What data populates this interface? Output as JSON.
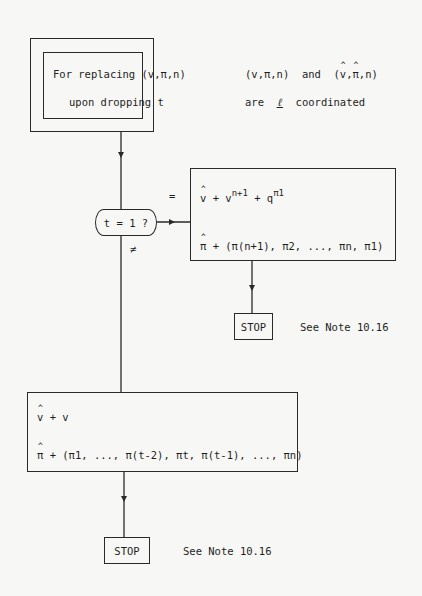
{
  "header_box": {
    "line1": "For replacing  (v,π,n)",
    "line2": "upon dropping t"
  },
  "side_note": {
    "line1_a": "(v,π,n)",
    "line1_and": "and",
    "line1_b": "(v,π,n)",
    "line2_are": "are",
    "line2_l": "ℓ",
    "line2_coord": "coordinated"
  },
  "decision": {
    "label": "t = 1 ?",
    "eq_label": "=",
    "neq_label": "≠"
  },
  "true_branch": {
    "v_lhs": "v",
    "v_rhs_base": "+ v",
    "v_rhs_sup": "n+1",
    "v_rhs_q": "+ q",
    "v_rhs_qsup": "π1",
    "pi_lhs": "π",
    "pi_rhs": "+ (π(n+1), π2, ..., πn, π1)"
  },
  "stop1": {
    "label": "STOP",
    "note": "See Note 10.16"
  },
  "false_branch": {
    "v_lhs": "v",
    "v_rhs": "+ v",
    "pi_lhs": "π",
    "pi_rhs": "+ (π1, ..., π(t-2), πt, π(t-1), ..., πn)"
  },
  "stop2": {
    "label": "STOP",
    "note": "See Note 10.16"
  }
}
